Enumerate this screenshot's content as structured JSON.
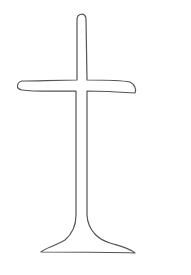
{
  "drawing": {
    "subject": "cross-outline",
    "stroke_color": "#555555",
    "background_color": "#ffffff"
  }
}
